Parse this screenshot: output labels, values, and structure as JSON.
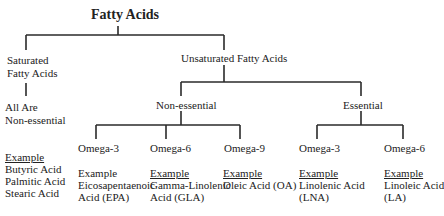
{
  "title": "Fatty Acids",
  "saturated": {
    "label_line1": "Saturated",
    "label_line2": "Fatty Acids",
    "note_line1": "All Are",
    "note_line2": "Non-essential",
    "example_label": "Example",
    "examples": [
      "Butyric Acid",
      "Palmitic Acid",
      "Stearic Acid"
    ]
  },
  "unsaturated": {
    "label": "Unsaturated Fatty Acids",
    "non_essential": {
      "label": "Non-essential",
      "children": [
        {
          "label": "Omega-3",
          "example_label": "Example",
          "example_underlined": false,
          "example_lines": [
            "Eicosapentaenoic",
            "Acid (EPA)"
          ]
        },
        {
          "label": "Omega-6",
          "example_label": "Example",
          "example_underlined": true,
          "example_lines": [
            "Gamma-Linolenic",
            "Acid (GLA)"
          ]
        },
        {
          "label": "Omega-9",
          "example_label": "Example",
          "example_underlined": true,
          "example_lines": [
            "Oleic Acid (OA)"
          ]
        }
      ]
    },
    "essential": {
      "label": "Essential",
      "children": [
        {
          "label": "Omega-3",
          "example_label": "Example",
          "example_underlined": true,
          "example_lines": [
            "Linolenic Acid",
            "(LNA)"
          ]
        },
        {
          "label": "Omega-6",
          "example_label": "Example",
          "example_underlined": true,
          "example_lines": [
            "Linoleic Acid",
            "(LA)"
          ]
        }
      ]
    }
  }
}
